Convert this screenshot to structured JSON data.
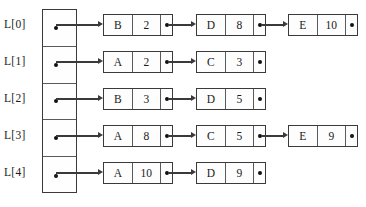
{
  "diagram": {
    "array_name": "L",
    "colors": {
      "border": "#3a3a3a",
      "inner_divider": "#5a5a5a",
      "dot": "#111111",
      "node_fill": "#fdfdfd",
      "background": "#ffffff"
    },
    "rows": [
      {
        "label": "L[0]",
        "index": 0,
        "nodes": [
          {
            "key": "B",
            "value": "2",
            "pointer": "dot",
            "has_next": true
          },
          {
            "key": "D",
            "value": "8",
            "pointer": "dot",
            "has_next": true
          },
          {
            "key": "E",
            "value": "10",
            "pointer": "dot",
            "has_next": false
          }
        ]
      },
      {
        "label": "L[1]",
        "index": 1,
        "nodes": [
          {
            "key": "A",
            "value": "2",
            "pointer": "dot",
            "has_next": true
          },
          {
            "key": "C",
            "value": "3",
            "pointer": "dot",
            "has_next": false
          }
        ]
      },
      {
        "label": "L[2]",
        "index": 2,
        "nodes": [
          {
            "key": "B",
            "value": "3",
            "pointer": "dot",
            "has_next": true
          },
          {
            "key": "D",
            "value": "5",
            "pointer": "dot",
            "has_next": false
          }
        ]
      },
      {
        "label": "L[3]",
        "index": 3,
        "nodes": [
          {
            "key": "A",
            "value": "8",
            "pointer": "dot",
            "has_next": true
          },
          {
            "key": "C",
            "value": "5",
            "pointer": "dot",
            "has_next": true
          },
          {
            "key": "E",
            "value": "9",
            "pointer": "dot",
            "has_next": false
          }
        ]
      },
      {
        "label": "L[4]",
        "index": 4,
        "nodes": [
          {
            "key": "A",
            "value": "10",
            "pointer": "dot",
            "has_next": true
          },
          {
            "key": "D",
            "value": "9",
            "pointer": "dot",
            "has_next": false
          }
        ]
      }
    ]
  },
  "layout": {
    "row_tops": [
      14,
      51,
      88,
      125,
      162
    ],
    "label_tops": [
      18,
      55,
      92,
      129,
      166
    ],
    "node_lefts": [
      103,
      196,
      288
    ],
    "node_width": 70,
    "node_height": 22,
    "array_left": 42,
    "array_top": 9,
    "array_width": 35,
    "array_height": 184
  }
}
